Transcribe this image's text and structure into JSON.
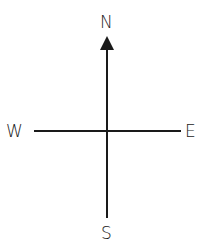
{
  "diagram": {
    "type": "compass-rose",
    "labels": {
      "north": "N",
      "south": "S",
      "east": "E",
      "west": "W"
    },
    "arrow_direction": "north",
    "line_color": "#1a1a1a"
  }
}
